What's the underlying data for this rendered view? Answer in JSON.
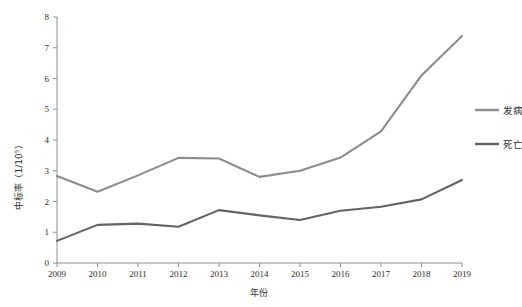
{
  "chart_data": {
    "type": "line",
    "title": "",
    "xlabel": "年份",
    "ylabel": "中标率（1/10⁵）",
    "ylabel_base": "中标率（1/10",
    "ylabel_exp": "5",
    "ylabel_tail": "）",
    "categories": [
      "2009",
      "2010",
      "2011",
      "2012",
      "2013",
      "2014",
      "2015",
      "2016",
      "2017",
      "2018",
      "2019"
    ],
    "x": [
      2009,
      2010,
      2011,
      2012,
      2013,
      2014,
      2015,
      2016,
      2017,
      2018,
      2019
    ],
    "xlim": [
      2009,
      2019
    ],
    "ylim": [
      0,
      8
    ],
    "yticks": [
      "0",
      "1",
      "2",
      "3",
      "4",
      "5",
      "6",
      "7",
      "8"
    ],
    "ytick_values": [
      0,
      1,
      2,
      3,
      4,
      5,
      6,
      7,
      8
    ],
    "grid": false,
    "legend_position": "right",
    "series": [
      {
        "name": "发病",
        "color": "#8c8c8c",
        "values": [
          2.83,
          2.32,
          2.85,
          3.42,
          3.4,
          2.8,
          3.0,
          3.43,
          4.28,
          6.1,
          7.38
        ]
      },
      {
        "name": "死亡",
        "color": "#636363",
        "values": [
          0.72,
          1.24,
          1.28,
          1.18,
          1.72,
          1.55,
          1.4,
          1.7,
          1.83,
          2.07,
          2.7
        ]
      }
    ]
  },
  "legend": {
    "items": [
      {
        "label": "发病",
        "color": "#8c8c8c"
      },
      {
        "label": "死亡",
        "color": "#636363"
      }
    ]
  },
  "axes": {
    "y_title": "中标率（1/10⁵）",
    "x_title": "年份"
  }
}
